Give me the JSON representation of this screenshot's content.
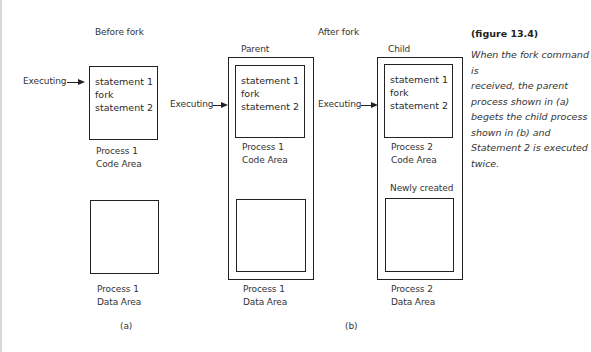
{
  "diagram": {
    "before": {
      "heading": "Before fork",
      "executing_label": "Executing",
      "code_statements": [
        "statement 1",
        "fork",
        "statement 2"
      ],
      "code_label": [
        "Process 1",
        "Code Area"
      ],
      "data_label": [
        "Process 1",
        "Data Area"
      ],
      "sublabel": "(a)"
    },
    "after": {
      "heading": "After fork",
      "sublabel": "(b)",
      "parent": {
        "title": "Parent",
        "executing_label": "Executing",
        "code_statements": [
          "statement 1",
          "fork",
          "statement 2"
        ],
        "code_label": [
          "Process 1",
          "Code Area"
        ],
        "data_label": [
          "Process 1",
          "Data Area"
        ]
      },
      "child": {
        "title": "Child",
        "executing_label": "Executing",
        "code_statements": [
          "statement 1",
          "fork",
          "statement 2"
        ],
        "code_label": [
          "Process 2",
          "Code Area"
        ],
        "newly_created": "Newly created",
        "data_label": [
          "Process 2",
          "Data Area"
        ]
      }
    }
  },
  "caption": {
    "title": "(figure 13.4)",
    "lines": [
      "When the fork command is",
      "received, the parent",
      "process shown in (a)",
      "begets the child process",
      "shown in (b) and",
      "Statement 2 is executed",
      "twice."
    ]
  }
}
